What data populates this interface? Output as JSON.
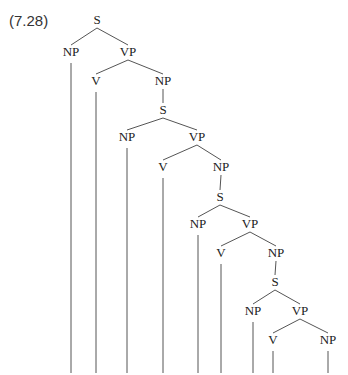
{
  "example_label": "(7.28)",
  "tree": {
    "nodes": [
      {
        "id": "s1",
        "label": "S"
      },
      {
        "id": "np1",
        "label": "NP"
      },
      {
        "id": "vp1",
        "label": "VP"
      },
      {
        "id": "v1",
        "label": "V"
      },
      {
        "id": "np2",
        "label": "NP"
      },
      {
        "id": "s2",
        "label": "S"
      },
      {
        "id": "np3",
        "label": "NP"
      },
      {
        "id": "vp2",
        "label": "VP"
      },
      {
        "id": "v2",
        "label": "V"
      },
      {
        "id": "np4",
        "label": "NP"
      },
      {
        "id": "s3",
        "label": "S"
      },
      {
        "id": "np5",
        "label": "NP"
      },
      {
        "id": "vp3",
        "label": "VP"
      },
      {
        "id": "v3",
        "label": "V"
      },
      {
        "id": "np6",
        "label": "NP"
      },
      {
        "id": "s4",
        "label": "S"
      },
      {
        "id": "np7",
        "label": "NP"
      },
      {
        "id": "vp4",
        "label": "VP"
      },
      {
        "id": "v4",
        "label": "V"
      },
      {
        "id": "np8",
        "label": "NP"
      }
    ],
    "edges": [
      [
        "s1",
        "np1"
      ],
      [
        "s1",
        "vp1"
      ],
      [
        "vp1",
        "v1"
      ],
      [
        "vp1",
        "np2"
      ],
      [
        "np2",
        "s2"
      ],
      [
        "s2",
        "np3"
      ],
      [
        "s2",
        "vp2"
      ],
      [
        "vp2",
        "v2"
      ],
      [
        "vp2",
        "np4"
      ],
      [
        "np4",
        "s3"
      ],
      [
        "s3",
        "np5"
      ],
      [
        "s3",
        "vp3"
      ],
      [
        "vp3",
        "v3"
      ],
      [
        "vp3",
        "np6"
      ],
      [
        "np6",
        "s4"
      ],
      [
        "s4",
        "np7"
      ],
      [
        "s4",
        "vp4"
      ],
      [
        "vp4",
        "v4"
      ],
      [
        "vp4",
        "np8"
      ]
    ],
    "open_leaves": [
      "np1",
      "v1",
      "np3",
      "v2",
      "np5",
      "v3",
      "np7",
      "v4",
      "np8"
    ]
  }
}
